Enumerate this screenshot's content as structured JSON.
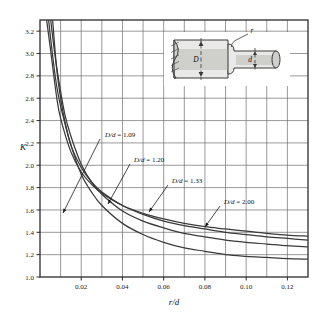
{
  "chart_data": {
    "type": "line",
    "title": "",
    "xlabel": "r/d",
    "ylabel": "K",
    "xlim": [
      0,
      0.13
    ],
    "ylim": [
      1.0,
      3.3
    ],
    "grid": true,
    "legend_position": "inline-annotations",
    "xticks": [
      "0.02",
      "0.04",
      "0.06",
      "0.08",
      "0.10",
      "0.12"
    ],
    "xtick_values": [
      0.02,
      0.04,
      0.06,
      0.08,
      0.1,
      0.12
    ],
    "yticks": [
      "1.0",
      "1.2",
      "1.4",
      "1.6",
      "1.8",
      "2.0",
      "2.2",
      "2.4",
      "2.6",
      "2.8",
      "3.0",
      "3.2"
    ],
    "ytick_values": [
      1.0,
      1.2,
      1.4,
      1.6,
      1.8,
      2.0,
      2.2,
      2.4,
      2.6,
      2.8,
      3.0,
      3.2
    ],
    "minor_x_step": 0.01,
    "series": [
      {
        "name": "D/d = 2.00",
        "x": [
          0.003,
          0.005,
          0.008,
          0.01,
          0.015,
          0.02,
          0.025,
          0.03,
          0.04,
          0.05,
          0.06,
          0.07,
          0.08,
          0.09,
          0.1,
          0.11,
          0.12,
          0.13
        ],
        "values": [
          3.33,
          3.05,
          2.62,
          2.42,
          2.12,
          1.94,
          1.83,
          1.75,
          1.64,
          1.57,
          1.52,
          1.48,
          1.45,
          1.43,
          1.41,
          1.39,
          1.375,
          1.365
        ]
      },
      {
        "name": "D/d = 1.33",
        "x": [
          0.004,
          0.006,
          0.008,
          0.01,
          0.015,
          0.02,
          0.025,
          0.03,
          0.04,
          0.05,
          0.06,
          0.07,
          0.08,
          0.09,
          0.1,
          0.11,
          0.12,
          0.13
        ],
        "values": [
          3.33,
          3.0,
          2.72,
          2.53,
          2.18,
          1.98,
          1.85,
          1.76,
          1.64,
          1.56,
          1.5,
          1.46,
          1.43,
          1.4,
          1.38,
          1.36,
          1.345,
          1.33
        ]
      },
      {
        "name": "D/d = 1.20",
        "x": [
          0.005,
          0.007,
          0.009,
          0.012,
          0.015,
          0.02,
          0.025,
          0.03,
          0.04,
          0.05,
          0.06,
          0.07,
          0.08,
          0.09,
          0.1,
          0.11,
          0.12,
          0.13
        ],
        "values": [
          3.33,
          3.02,
          2.77,
          2.46,
          2.26,
          2.01,
          1.85,
          1.74,
          1.59,
          1.5,
          1.44,
          1.39,
          1.36,
          1.33,
          1.31,
          1.295,
          1.28,
          1.27
        ]
      },
      {
        "name": "D/d = 1.09",
        "x": [
          0.006,
          0.008,
          0.01,
          0.012,
          0.015,
          0.02,
          0.025,
          0.03,
          0.04,
          0.05,
          0.06,
          0.07,
          0.08,
          0.09,
          0.1,
          0.11,
          0.12,
          0.13
        ],
        "values": [
          3.33,
          2.88,
          2.6,
          2.4,
          2.18,
          1.92,
          1.76,
          1.64,
          1.48,
          1.38,
          1.31,
          1.26,
          1.23,
          1.2,
          1.185,
          1.175,
          1.165,
          1.16
        ]
      }
    ],
    "annotations": [
      {
        "text_prefix": "D/d",
        "text_value": " = 1.09",
        "label": "D/d = 1.09",
        "label_x": 105,
        "label_y": 137,
        "leader_from_x": 100,
        "leader_from_y": 139,
        "leader_to_x": 63,
        "leader_to_y": 213
      },
      {
        "text_prefix": "D/d",
        "text_value": " = 1.20",
        "label": "D/d = 1.20",
        "label_x": 134,
        "label_y": 162,
        "leader_from_x": 130,
        "leader_from_y": 164,
        "leader_to_x": 108,
        "leader_to_y": 204
      },
      {
        "text_prefix": "D/d",
        "text_value": " = 1.33",
        "label": "D/d = 1.33",
        "label_x": 172,
        "label_y": 183,
        "leader_from_x": 168,
        "leader_from_y": 185,
        "leader_to_x": 149,
        "leader_to_y": 212
      },
      {
        "text_prefix": "D/d",
        "text_value": " = 2.00",
        "label": "D/d = 2.00",
        "label_x": 224,
        "label_y": 204,
        "leader_from_x": 220,
        "leader_from_y": 206,
        "leader_to_x": 205,
        "leader_to_y": 227
      }
    ],
    "inset": {
      "name": "stepped-shaft-fillet-diagram",
      "labels": {
        "large_diameter": "D",
        "small_diameter": "d",
        "fillet_radius": "r"
      }
    }
  },
  "colors": {
    "curve": "#3a3a3a",
    "grid": "#6d6d6d",
    "frame": "#2b2b2b",
    "text": "#1a1a1a",
    "inset_fill_light": "#e9e9e7",
    "inset_fill_mid": "#cfcfcb",
    "inset_outline": "#3a3a3a"
  }
}
